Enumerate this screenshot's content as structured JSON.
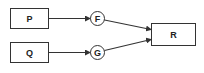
{
  "diagram": {
    "nodes": [
      {
        "id": "P",
        "label": "P",
        "shape": "rect"
      },
      {
        "id": "Q",
        "label": "Q",
        "shape": "rect"
      },
      {
        "id": "F",
        "label": "F",
        "shape": "circle"
      },
      {
        "id": "G",
        "label": "G",
        "shape": "circle"
      },
      {
        "id": "R",
        "label": "R",
        "shape": "rect"
      }
    ],
    "edges": [
      {
        "from": "P",
        "to": "F",
        "arrow": true
      },
      {
        "from": "Q",
        "to": "G",
        "arrow": true
      },
      {
        "from": "F",
        "to": "R",
        "arrow": true
      },
      {
        "from": "G",
        "to": "R",
        "arrow": true
      }
    ],
    "colors": {
      "stroke": "#333333",
      "background": "#ffffff",
      "text": "#222222"
    }
  }
}
